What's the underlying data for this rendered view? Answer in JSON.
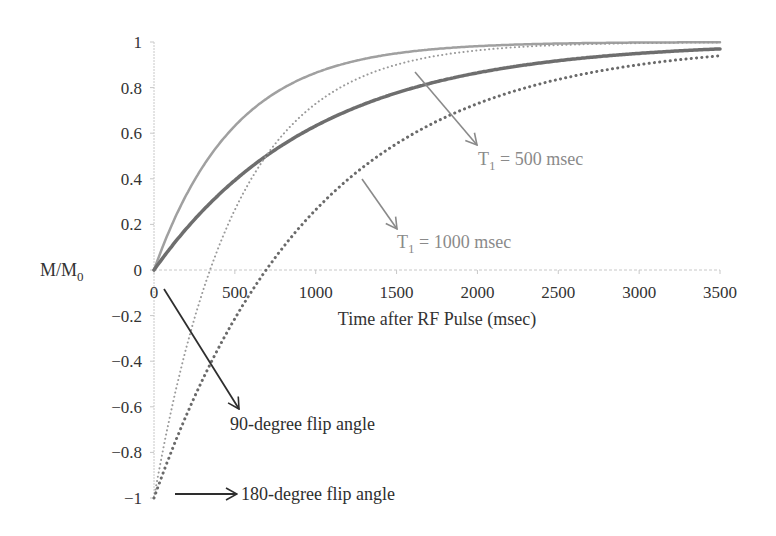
{
  "chart_data": {
    "type": "line",
    "title": "",
    "xlabel": "Time after RF Pulse (msec)",
    "ylabel": "M/M0",
    "ylabel_main": "M/M",
    "ylabel_sub": "0",
    "xlim": [
      0,
      3500
    ],
    "ylim": [
      -1,
      1
    ],
    "x_ticks": [
      0,
      500,
      1000,
      1500,
      2000,
      2500,
      3000,
      3500
    ],
    "x_tick_labels": [
      "0",
      "500",
      "1000",
      "1500",
      "2000",
      "2500",
      "3000",
      "3500"
    ],
    "y_ticks": [
      1,
      0.8,
      0.6,
      0.4,
      0.2,
      0,
      -0.2,
      -0.4,
      -0.6,
      -0.8,
      -1
    ],
    "y_tick_labels": [
      "1",
      "0.8",
      "0.6",
      "0.4",
      "0.2",
      "0",
      "−0.2",
      "−0.4",
      "−0.6",
      "−0.8",
      "−1"
    ],
    "grid": false,
    "legend": "none (inline annotations)",
    "x": [
      0,
      250,
      500,
      750,
      1000,
      1500,
      2000,
      2500,
      3000,
      3500
    ],
    "series": [
      {
        "name": "T1 = 500 msec, 90-degree flip",
        "style": "solid",
        "color": "#a0a0a0",
        "width": 2.5,
        "T1": 500,
        "flip": 90,
        "values": [
          0,
          0.39,
          0.63,
          0.78,
          0.86,
          0.95,
          0.98,
          0.99,
          1.0,
          1.0
        ]
      },
      {
        "name": "T1 = 1000 msec, 90-degree flip",
        "style": "solid",
        "color": "#6e6e6e",
        "width": 3.5,
        "T1": 1000,
        "flip": 90,
        "values": [
          0,
          0.22,
          0.39,
          0.53,
          0.63,
          0.78,
          0.86,
          0.92,
          0.95,
          0.97
        ]
      },
      {
        "name": "T1 = 500 msec, 180-degree flip",
        "style": "dotted",
        "color": "#9a9a9a",
        "width": 2,
        "T1": 500,
        "flip": 180,
        "values": [
          -1,
          -0.21,
          0.26,
          0.55,
          0.73,
          0.9,
          0.96,
          0.99,
          0.99,
          1.0
        ]
      },
      {
        "name": "T1 = 1000 msec, 180-degree flip",
        "style": "dotted",
        "color": "#6a6a6a",
        "width": 3,
        "T1": 1000,
        "flip": 180,
        "values": [
          -1,
          -0.56,
          -0.21,
          0.06,
          0.26,
          0.55,
          0.73,
          0.84,
          0.9,
          0.94
        ]
      }
    ],
    "annotations": [
      {
        "text_main": "T",
        "text_sub": "1",
        "text_rest": " = 500 msec",
        "color": "#8a8a8a"
      },
      {
        "text_main": "T",
        "text_sub": "1",
        "text_rest": " = 1000 msec",
        "color": "#8a8a8a"
      },
      {
        "text": "90-degree flip angle",
        "color": "#2e2e2e"
      },
      {
        "text": "180-degree flip angle",
        "color": "#2e2e2e"
      }
    ]
  }
}
